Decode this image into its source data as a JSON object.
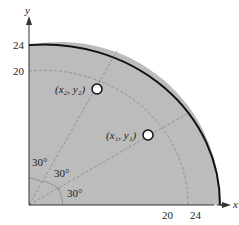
{
  "axes": {
    "x_label": "x",
    "y_label": "y",
    "x_ticks": [
      "20",
      "24"
    ],
    "y_ticks": [
      "24",
      "20"
    ]
  },
  "region": {
    "outer_radius": 24,
    "inner_dashed_radius": 20,
    "fill_color": "#b9b9b9",
    "boundary_color": "#111111"
  },
  "angles": [
    "30°",
    "30°",
    "30°"
  ],
  "points": [
    {
      "label": "(x₁, y₁)",
      "angle_deg": 30
    },
    {
      "label": "(x₂, y₂)",
      "angle_deg": 60
    }
  ]
}
